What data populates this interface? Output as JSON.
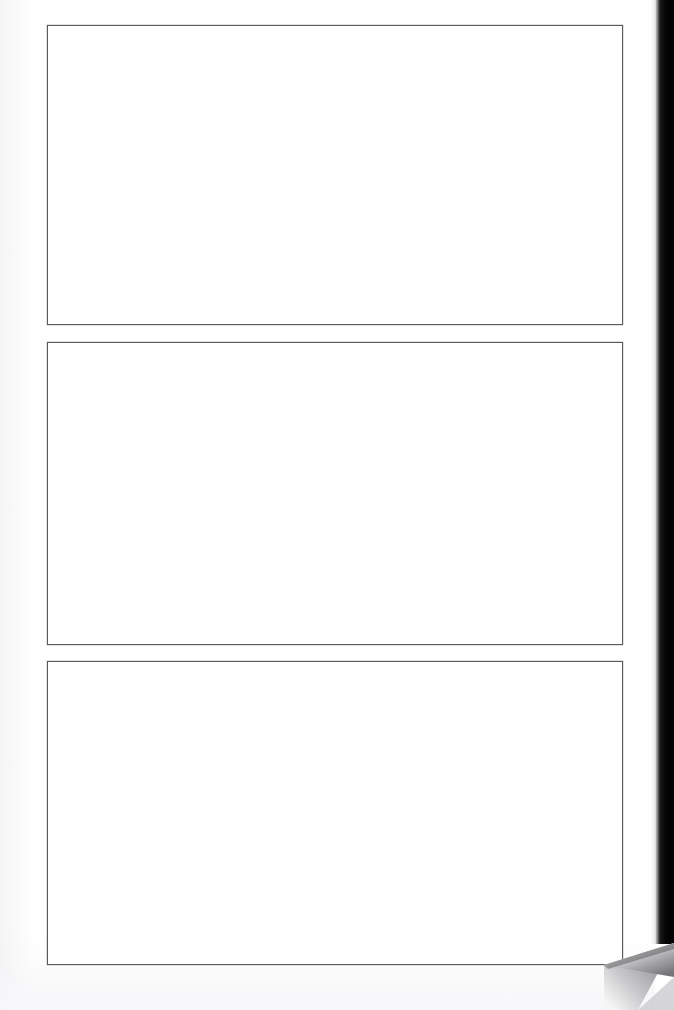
{
  "document": {
    "type": "scanned-page",
    "page_background": "#ffffff",
    "width": 674,
    "height": 1010,
    "caption": "",
    "visible_text": ""
  },
  "frames": [
    {
      "name": "frame-top",
      "label": "",
      "content": "",
      "border_color": "#5a5a5e",
      "fill_color": "#ffffff",
      "x": 47,
      "y": 25,
      "width": 576,
      "height": 300
    },
    {
      "name": "frame-middle",
      "label": "",
      "content": "",
      "border_color": "#5a5a5e",
      "fill_color": "#ffffff",
      "x": 47,
      "y": 342,
      "width": 576,
      "height": 303
    },
    {
      "name": "frame-bottom",
      "label": "",
      "content": "",
      "border_color": "#5a5a5e",
      "fill_color": "#ffffff",
      "x": 47,
      "y": 661,
      "width": 576,
      "height": 304
    }
  ],
  "gutter": {
    "name": "scanner-gutter-band",
    "color": "#000000",
    "highlight_color": "#e8e8ea",
    "x": 655,
    "y": 0,
    "width": 19,
    "height": 944
  },
  "page_curl": {
    "name": "page-curl-corner",
    "position": "bottom-right",
    "light_color": "#f4f4f4",
    "mid_color": "#b9b9bb",
    "dark_color": "#6e6e70"
  }
}
